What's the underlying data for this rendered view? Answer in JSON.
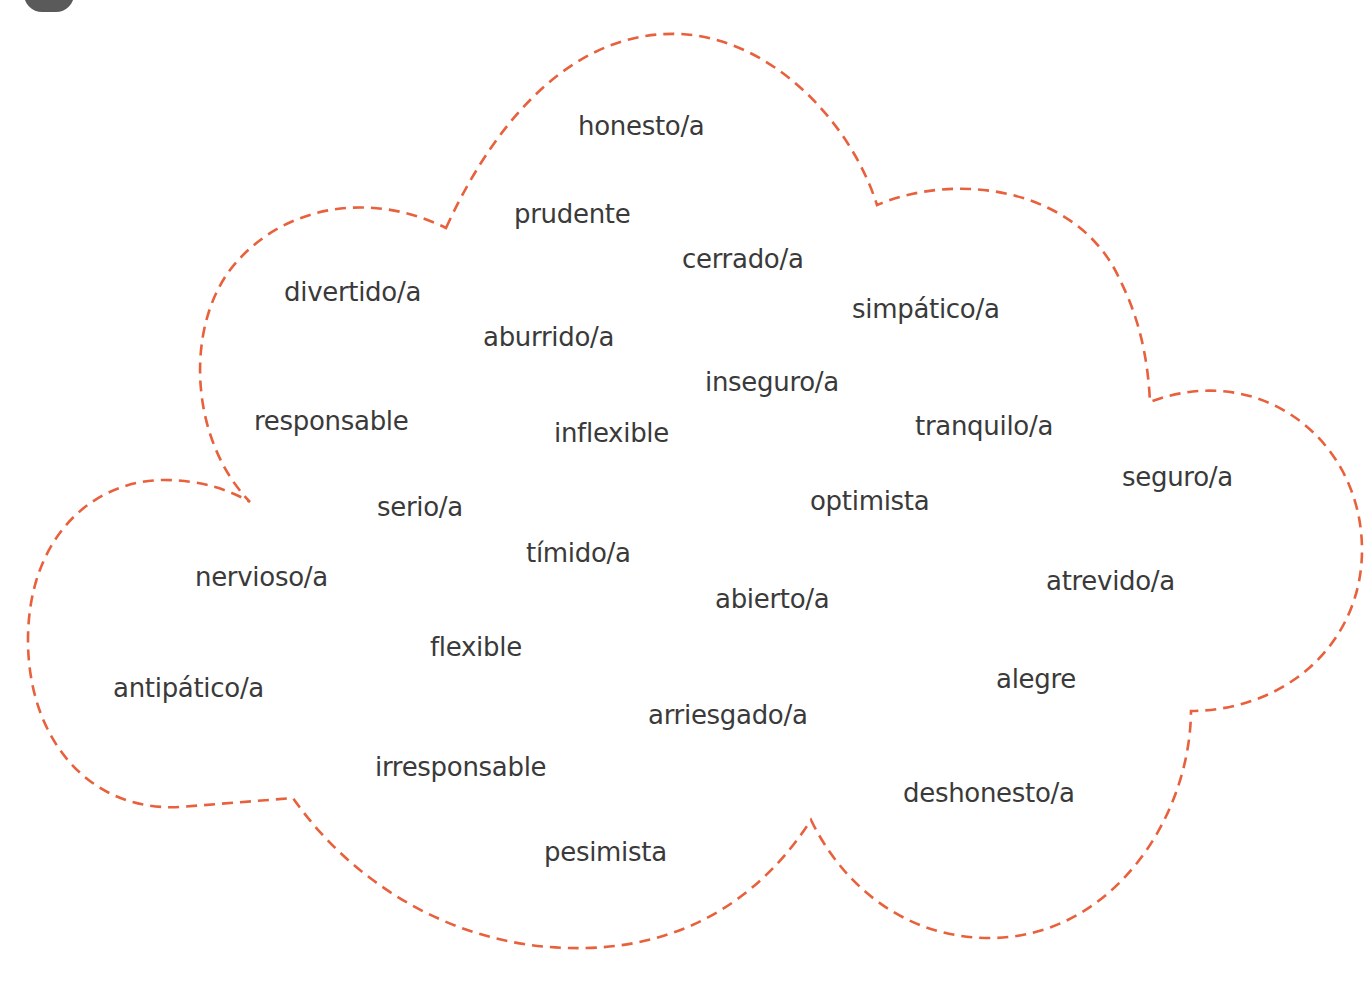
{
  "badge": {
    "color": "#5a5a5a"
  },
  "cloud": {
    "stroke_color": "#e8603c",
    "style": "dashed"
  },
  "words": [
    {
      "text": "honesto/a",
      "x": 578,
      "y": 113
    },
    {
      "text": "prudente",
      "x": 514,
      "y": 201
    },
    {
      "text": "cerrado/a",
      "x": 682,
      "y": 246
    },
    {
      "text": "divertido/a",
      "x": 284,
      "y": 279
    },
    {
      "text": "simpático/a",
      "x": 852,
      "y": 296
    },
    {
      "text": "aburrido/a",
      "x": 483,
      "y": 324
    },
    {
      "text": "inseguro/a",
      "x": 705,
      "y": 369
    },
    {
      "text": "responsable",
      "x": 254,
      "y": 408
    },
    {
      "text": "inflexible",
      "x": 554,
      "y": 420
    },
    {
      "text": "tranquilo/a",
      "x": 915,
      "y": 413
    },
    {
      "text": "seguro/a",
      "x": 1122,
      "y": 464
    },
    {
      "text": "optimista",
      "x": 810,
      "y": 488
    },
    {
      "text": "serio/a",
      "x": 377,
      "y": 494
    },
    {
      "text": "tímido/a",
      "x": 526,
      "y": 540
    },
    {
      "text": "nervioso/a",
      "x": 195,
      "y": 564
    },
    {
      "text": "atrevido/a",
      "x": 1046,
      "y": 568
    },
    {
      "text": "abierto/a",
      "x": 715,
      "y": 586
    },
    {
      "text": "flexible",
      "x": 430,
      "y": 634
    },
    {
      "text": "alegre",
      "x": 996,
      "y": 666
    },
    {
      "text": "antipático/a",
      "x": 113,
      "y": 675
    },
    {
      "text": "arriesgado/a",
      "x": 648,
      "y": 702
    },
    {
      "text": "irresponsable",
      "x": 375,
      "y": 754
    },
    {
      "text": "deshonesto/a",
      "x": 903,
      "y": 780
    },
    {
      "text": "pesimista",
      "x": 544,
      "y": 839
    }
  ]
}
